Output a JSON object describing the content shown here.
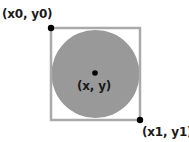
{
  "diagram": {
    "type": "bounding-box-circle",
    "labels": {
      "top_left": "(x0, y0)",
      "center": "(x, y)",
      "bottom_right": "(x1, y1)"
    },
    "colors": {
      "circle_fill": "#999999",
      "square_stroke": "#aaaaaa",
      "point": "#000000",
      "text": "#1a1a1a"
    },
    "geometry": {
      "square": {
        "x": 51,
        "y": 28,
        "width": 89,
        "height": 92
      },
      "circle": {
        "cx": 95.5,
        "cy": 74,
        "r": 44
      },
      "points": [
        {
          "name": "top-left",
          "x": 51,
          "y": 28
        },
        {
          "name": "center",
          "x": 95,
          "y": 73
        },
        {
          "name": "bottom-right",
          "x": 140,
          "y": 120
        }
      ]
    }
  }
}
